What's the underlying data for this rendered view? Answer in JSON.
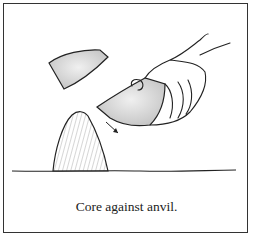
{
  "figure": {
    "caption": "Core against anvil.",
    "elements": [
      {
        "name": "flake",
        "description": "detached stone flake flying upward-left"
      },
      {
        "name": "hand-holding-core",
        "description": "right hand gripping stone core"
      },
      {
        "name": "core",
        "description": "stone core held in hand"
      },
      {
        "name": "anvil",
        "description": "conical anvil stone resting on ground"
      },
      {
        "name": "direction-arrow",
        "description": "arrow showing downward strike direction"
      },
      {
        "name": "ground-line",
        "description": "horizontal ground line"
      }
    ],
    "colors": {
      "line": "#222222",
      "stone_fill": "#d8d8d8",
      "frame": "#333333",
      "background": "#ffffff"
    }
  }
}
